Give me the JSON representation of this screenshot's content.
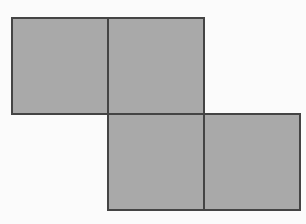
{
  "figure": {
    "fill_color": "#a9a9a9",
    "border_color": "#444444",
    "background_color": "#fbfbfb",
    "squares": [
      {
        "id": "top-left",
        "row": 0,
        "col": 0,
        "x": 11,
        "y": 17,
        "size": 98
      },
      {
        "id": "top-right",
        "row": 0,
        "col": 1,
        "x": 107,
        "y": 17,
        "size": 98
      },
      {
        "id": "bottom-left",
        "row": 1,
        "col": 1,
        "x": 107,
        "y": 113,
        "size": 98
      },
      {
        "id": "bottom-right",
        "row": 1,
        "col": 2,
        "x": 203,
        "y": 113,
        "size": 98
      }
    ]
  }
}
